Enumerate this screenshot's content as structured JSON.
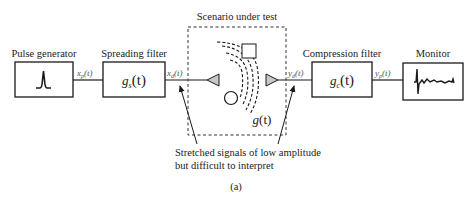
{
  "figure_label": "(a)",
  "blocks": {
    "pulse_generator": {
      "label": "Pulse generator"
    },
    "spreading_filter": {
      "label": "Spreading filter",
      "function": "g",
      "subscript": "s",
      "arg": "(t)"
    },
    "scenario": {
      "label": "Scenario under test",
      "function": "g",
      "arg": "(t)"
    },
    "compression_filter": {
      "label": "Compression filter",
      "function": "g",
      "subscript": "c",
      "arg": "(t)"
    },
    "monitor": {
      "label": "Monitor"
    }
  },
  "signals": {
    "xp": {
      "symbol": "x",
      "subscript": "p",
      "arg": "(t)"
    },
    "xd": {
      "symbol": "x",
      "subscript": "d",
      "arg": "(t)"
    },
    "yd": {
      "symbol": "y",
      "subscript": "d",
      "arg": "(t)"
    },
    "yp": {
      "symbol": "y",
      "subscript": "p",
      "arg": "(t)"
    }
  },
  "annotation": {
    "line1": "Stretched signals of low amplitude",
    "line2": "but difficult to interpret"
  },
  "colors": {
    "stroke": "#1a1a1a",
    "antenna_fill": "#c8c8c8"
  }
}
